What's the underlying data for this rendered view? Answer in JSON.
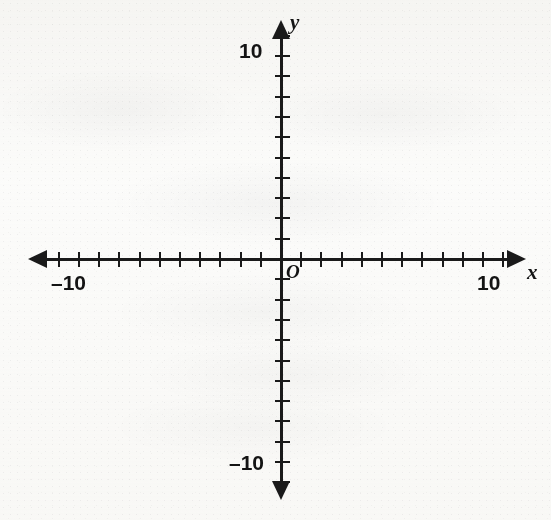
{
  "figure": {
    "kind": "coordinate-plane",
    "origin_label": "O",
    "x_axis_label": "x",
    "y_axis_label": "y",
    "background_color": "#fcfcfb",
    "ink_color": "#1a1a1a"
  },
  "labels": {
    "x_negative_ten": "–10",
    "x_positive_ten": "10",
    "y_positive_ten": "10",
    "y_negative_ten": "–10"
  },
  "ghost_text": {
    "line1": " ",
    "line2": " ",
    "line3": " ",
    "line4": " ",
    "line5": " "
  },
  "chart_data": {
    "type": "scatter",
    "title": "",
    "subtitle": "",
    "xlabel": "x",
    "ylabel": "y",
    "origin_label": "O",
    "grid": false,
    "legend": null,
    "series": [],
    "annotations": [],
    "xlim": [
      -11.5,
      11.5
    ],
    "ylim": [
      -11.5,
      11.5
    ],
    "xticks": [
      -11,
      -10,
      -9,
      -8,
      -7,
      -6,
      -5,
      -4,
      -3,
      -2,
      -1,
      1,
      2,
      3,
      4,
      5,
      6,
      7,
      8,
      9,
      10,
      11
    ],
    "yticks": [
      -11,
      -10,
      -9,
      -8,
      -7,
      -6,
      -5,
      -4,
      -3,
      -2,
      -1,
      1,
      2,
      3,
      4,
      5,
      6,
      7,
      8,
      9,
      10,
      11
    ],
    "x_tick_labels": {
      "-10": "–10",
      "10": "10"
    },
    "y_tick_labels": {
      "10": "10",
      "-10": "–10"
    },
    "tick_interval": 1,
    "labeled_ticks_only": [
      -10,
      10
    ],
    "axis_style": "double-arrow"
  },
  "geometry": {
    "origin_px": {
      "x": 281,
      "y": 259
    },
    "unit_px_x": 20.2,
    "unit_px_y": 20.3,
    "x_axis_span_px": {
      "left": 32,
      "right": 524
    },
    "y_axis_span_px": {
      "top": 22,
      "bottom": 500
    }
  }
}
